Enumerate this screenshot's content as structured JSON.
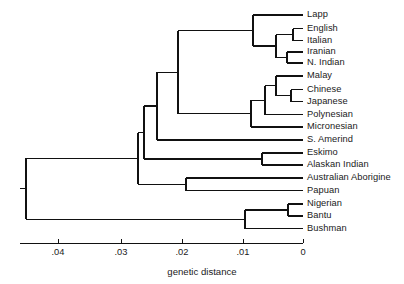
{
  "figure": {
    "type": "dendrogram",
    "axis_title": "genetic distance",
    "stroke_color": "#111111"
  },
  "chart_data": {
    "type": "line",
    "title": "",
    "subtitle": "",
    "xlabel": "genetic distance",
    "ylabel": "",
    "grid": false,
    "legend": "none",
    "axis": {
      "orientation": "horizontal-bottom",
      "direction": "right-to-left-decreasing",
      "xlim": [
        0.0465,
        0
      ],
      "ticks": [
        {
          "value": 0.04,
          "label": ".04",
          "px": 58
        },
        {
          "value": 0.03,
          "label": ".03",
          "px": 121
        },
        {
          "value": 0.02,
          "label": ".02",
          "px": 182
        },
        {
          "value": 0.01,
          "label": ".01",
          "px": 243
        },
        {
          "value": 0.0,
          "label": "0",
          "px": 303
        }
      ],
      "pixels_per_unit": 6100,
      "zero_px": 303
    },
    "leaves": [
      {
        "name": "Lapp",
        "y_px": 15.0,
        "tip_x_px": 303,
        "branch_x_px": 253
      },
      {
        "name": "English",
        "y_px": 28.5,
        "tip_x_px": 303,
        "branch_x_px": 293
      },
      {
        "name": "Italian",
        "y_px": 40.5,
        "tip_x_px": 303,
        "branch_x_px": 293
      },
      {
        "name": "Iranian",
        "y_px": 52.0,
        "tip_x_px": 303,
        "branch_x_px": 287
      },
      {
        "name": "N. Indian",
        "y_px": 63.0,
        "tip_x_px": 303,
        "branch_x_px": 287
      },
      {
        "name": "Malay",
        "y_px": 76.0,
        "tip_x_px": 303,
        "branch_x_px": 276
      },
      {
        "name": "Chinese",
        "y_px": 89.5,
        "tip_x_px": 303,
        "branch_x_px": 291
      },
      {
        "name": "Japanese",
        "y_px": 101.5,
        "tip_x_px": 303,
        "branch_x_px": 291
      },
      {
        "name": "Polynesian",
        "y_px": 114.5,
        "tip_x_px": 303,
        "branch_x_px": 265
      },
      {
        "name": "Micronesian",
        "y_px": 127.0,
        "tip_x_px": 303,
        "branch_x_px": 251
      },
      {
        "name": "S. Amerind",
        "y_px": 140.0,
        "tip_x_px": 303,
        "branch_x_px": 157
      },
      {
        "name": "Eskimo",
        "y_px": 153.0,
        "tip_x_px": 303,
        "branch_x_px": 262
      },
      {
        "name": "Alaskan Indian",
        "y_px": 165.0,
        "tip_x_px": 303,
        "branch_x_px": 262
      },
      {
        "name": "Australian Aborigine",
        "y_px": 178.0,
        "tip_x_px": 303,
        "branch_x_px": 186
      },
      {
        "name": "Papuan",
        "y_px": 190.5,
        "tip_x_px": 303,
        "branch_x_px": 186
      },
      {
        "name": "Nigerian",
        "y_px": 204.0,
        "tip_x_px": 303,
        "branch_x_px": 288
      },
      {
        "name": "Bantu",
        "y_px": 216.0,
        "tip_x_px": 303,
        "branch_x_px": 288
      },
      {
        "name": "Bushman",
        "y_px": 228.5,
        "tip_x_px": 303,
        "branch_x_px": 245
      }
    ],
    "internal_nodes": [
      {
        "id": "english-italian",
        "x_px": 293,
        "y_top_px": 28.5,
        "y_bot_px": 40.5,
        "parent_x_px": 276
      },
      {
        "id": "iranian-nindian",
        "x_px": 287,
        "y_top_px": 52.0,
        "y_bot_px": 63.0,
        "parent_x_px": 276
      },
      {
        "id": "caucasoid-core",
        "x_px": 276,
        "y_top_px": 34.5,
        "y_bot_px": 57.5,
        "parent_x_px": 253
      },
      {
        "id": "caucasoid",
        "x_px": 253,
        "y_top_px": 15.0,
        "y_bot_px": 46.0,
        "parent_x_px": 178
      },
      {
        "id": "chinese-japanese",
        "x_px": 291,
        "y_top_px": 89.5,
        "y_bot_px": 101.5,
        "parent_x_px": 276
      },
      {
        "id": "malay-sinojapanese",
        "x_px": 276,
        "y_top_px": 76.0,
        "y_bot_px": 95.5,
        "parent_x_px": 265
      },
      {
        "id": "southeast-asian",
        "x_px": 265,
        "y_top_px": 85.8,
        "y_bot_px": 114.5,
        "parent_x_px": 251
      },
      {
        "id": "asian-pacific",
        "x_px": 251,
        "y_top_px": 100.2,
        "y_bot_px": 127.0,
        "parent_x_px": 178
      },
      {
        "id": "eurasian",
        "x_px": 178,
        "y_top_px": 30.5,
        "y_bot_px": 113.6,
        "parent_x_px": 157
      },
      {
        "id": "eurasian-amerind",
        "x_px": 157,
        "y_top_px": 72.0,
        "y_bot_px": 140.0,
        "parent_x_px": 144
      },
      {
        "id": "eskimo-alaskan",
        "x_px": 262,
        "y_top_px": 153.0,
        "y_bot_px": 165.0,
        "parent_x_px": 144
      },
      {
        "id": "northern",
        "x_px": 144,
        "y_top_px": 106.0,
        "y_bot_px": 159.0,
        "parent_x_px": 138
      },
      {
        "id": "australian-papuan",
        "x_px": 186,
        "y_top_px": 178.0,
        "y_bot_px": 190.5,
        "parent_x_px": 138
      },
      {
        "id": "non-african",
        "x_px": 138,
        "y_top_px": 132.5,
        "y_bot_px": 184.2,
        "parent_x_px": 26
      },
      {
        "id": "nigerian-bantu",
        "x_px": 288,
        "y_top_px": 204.0,
        "y_bot_px": 216.0,
        "parent_x_px": 245
      },
      {
        "id": "african",
        "x_px": 245,
        "y_top_px": 210.0,
        "y_bot_px": 228.5,
        "parent_x_px": 26
      },
      {
        "id": "root",
        "x_px": 26,
        "y_top_px": 158.3,
        "y_bot_px": 219.2,
        "parent_x_px": 20
      }
    ]
  }
}
